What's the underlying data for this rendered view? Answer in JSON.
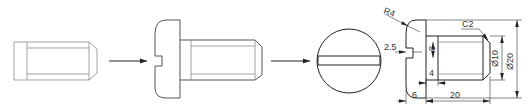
{
  "diagram": {
    "type": "engineering-drawing",
    "steps": [
      {
        "id": "blank",
        "description": "chamfered cylindrical shank"
      },
      {
        "id": "assembled",
        "description": "shank with slotted rounded head added"
      },
      {
        "id": "end-view",
        "description": "end view showing slot"
      },
      {
        "id": "dimensioned",
        "description": "dimensioned side view"
      }
    ],
    "arrows": 2,
    "colors": {
      "line_light": "#8a8a8a",
      "line_mid": "#555555",
      "line_dark": "#222222",
      "text": "#333333",
      "background": "#ffffff"
    }
  },
  "dimensions": {
    "radius": "R4",
    "chamfer": "C2",
    "slot_depth": "2.5",
    "slot_width": "3",
    "neck_length": "4",
    "head_length": "6",
    "shank_length": "20",
    "shank_diameter": "Ø10",
    "head_diameter": "Ø20"
  }
}
